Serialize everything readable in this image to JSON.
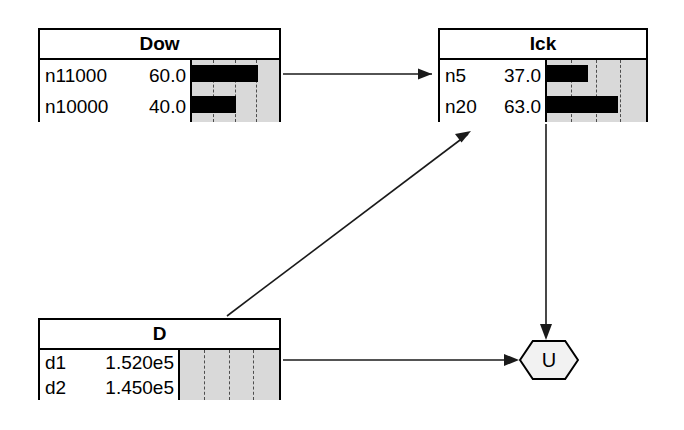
{
  "diagram": {
    "background": "#ffffff",
    "line_color": "#1a1a1a",
    "bar_color": "#000000",
    "chart_bg": "#d9d9d9",
    "nodes": [
      {
        "id": "dow",
        "title": "Dow",
        "x": 38,
        "y": 28,
        "w": 243,
        "h": 94,
        "label_width": 152,
        "gridlines": 3,
        "rows": [
          {
            "key": "n11000",
            "value": "60.0",
            "bar_pct": 78
          },
          {
            "key": "n10000",
            "value": "40.0",
            "bar_pct": 52
          }
        ]
      },
      {
        "id": "ick",
        "title": "Ick",
        "x": 438,
        "y": 28,
        "w": 210,
        "h": 94,
        "label_width": 107,
        "gridlines": 3,
        "rows": [
          {
            "key": "n5",
            "value": "37.0",
            "bar_pct": 42
          },
          {
            "key": "n20",
            "value": "63.0",
            "bar_pct": 73
          }
        ]
      },
      {
        "id": "d",
        "title": "D",
        "x": 38,
        "y": 318,
        "w": 243,
        "h": 82,
        "label_width": 140,
        "gridlines": 3,
        "rows": [
          {
            "key": "d1",
            "value": "1.520e5",
            "bar_pct": 0
          },
          {
            "key": "d2",
            "value": "1.450e5",
            "bar_pct": 0
          }
        ]
      }
    ],
    "hex_nodes": [
      {
        "id": "u",
        "label": "U",
        "x": 519,
        "y": 340,
        "w": 60,
        "h": 40
      }
    ],
    "edges": [
      {
        "id": "dow-to-ick",
        "from": "dow",
        "to": "ick",
        "path": "M 283 74 L 432 74",
        "arrow": "M 432 74 L 418 68.5 L 418 79.5 Z"
      },
      {
        "id": "d-to-ick",
        "from": "d",
        "to": "ick",
        "path": "M 227 316 L 468 134",
        "arrow": "M 471 131 L 455 134 L 461.5 142.5 Z"
      },
      {
        "id": "ick-to-u",
        "from": "ick",
        "to": "u",
        "path": "M 546 124 L 546 332",
        "arrow": "M 546 340 L 540 324 L 552 324 Z"
      },
      {
        "id": "d-to-u",
        "from": "d",
        "to": "u",
        "path": "M 283 360 L 513 360",
        "arrow": "M 519 360 L 504 354 L 504 366 Z"
      }
    ]
  }
}
